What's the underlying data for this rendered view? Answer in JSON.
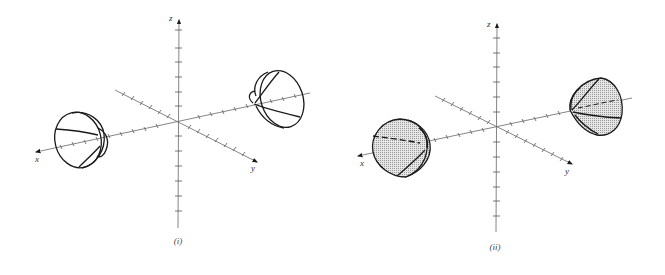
{
  "figure": {
    "panels": [
      {
        "id": "i",
        "caption": "(i)",
        "style": "wireframe",
        "axes": {
          "x_label": "x",
          "y_label": "y",
          "z_label": "z"
        },
        "surfaces": [
          "left-paraboloid-nappe",
          "right-paraboloid-nappe"
        ]
      },
      {
        "id": "ii",
        "caption": "(ii)",
        "style": "shaded",
        "axes": {
          "x_label": "x",
          "y_label": "y",
          "z_label": "z"
        },
        "surfaces": [
          "left-paraboloid-nappe",
          "right-paraboloid-nappe"
        ]
      }
    ],
    "colors": {
      "line": "#1a1a1a",
      "axis": "#555555",
      "fill": "#d6d6d6",
      "background": "#ffffff"
    }
  }
}
